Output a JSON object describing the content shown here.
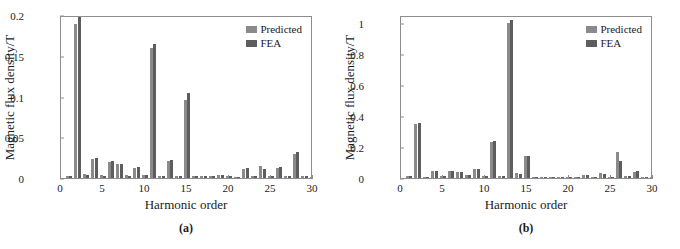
{
  "figure": {
    "panels": [
      {
        "subcaption": "(a)",
        "legend": {
          "predicted": "Predicted",
          "fea": "FEA"
        },
        "chart_data": {
          "type": "bar",
          "title": "",
          "subtitle": "",
          "xlabel": "Harmonic order",
          "ylabel": "Magnetic flux density/T",
          "xlim": [
            0,
            30
          ],
          "ylim": [
            0,
            0.2
          ],
          "xticks": [
            0,
            5,
            10,
            15,
            20,
            25,
            30
          ],
          "yticks": [
            0,
            0.05,
            0.1,
            0.15,
            0.2
          ],
          "ytick_labels": [
            "0",
            "0.05",
            "0.1",
            "0.15",
            "0.2"
          ],
          "grid": false,
          "legend_position": "top-right",
          "categories": [
            1,
            2,
            3,
            4,
            5,
            6,
            7,
            8,
            9,
            10,
            11,
            12,
            13,
            14,
            15,
            16,
            17,
            18,
            19,
            20,
            21,
            22,
            23,
            24,
            25,
            26,
            27,
            28,
            29,
            30
          ],
          "series": [
            {
              "name": "Predicted",
              "color": "#8a8a8a",
              "values": [
                0.003,
                0.189,
                0.005,
                0.023,
                0.004,
                0.02,
                0.017,
                0.004,
                0.012,
                0.004,
                0.16,
                0.003,
                0.021,
                0.003,
                0.096,
                0.002,
                0.003,
                0.002,
                0.004,
                0.002,
                0.001,
                0.011,
                0.002,
                0.015,
                0.002,
                0.012,
                0.002,
                0.03,
                0.002,
                0.001
              ]
            },
            {
              "name": "FEA",
              "color": "#5d5d5d",
              "values": [
                0.003,
                0.197,
                0.004,
                0.024,
                0.003,
                0.021,
                0.017,
                0.003,
                0.013,
                0.004,
                0.164,
                0.003,
                0.022,
                0.003,
                0.104,
                0.002,
                0.003,
                0.002,
                0.004,
                0.002,
                0.001,
                0.012,
                0.002,
                0.011,
                0.002,
                0.014,
                0.002,
                0.032,
                0.002,
                0.001
              ]
            }
          ]
        }
      },
      {
        "subcaption": "(b)",
        "legend": {
          "predicted": "Predicted",
          "fea": "FEA"
        },
        "chart_data": {
          "type": "bar",
          "title": "",
          "subtitle": "",
          "xlabel": "Harmonic order",
          "ylabel": "Magnetic flux density/T",
          "xlim": [
            0,
            30
          ],
          "ylim": [
            0,
            1.05
          ],
          "xticks": [
            0,
            5,
            10,
            15,
            20,
            25,
            30
          ],
          "yticks": [
            0,
            0.2,
            0.4,
            0.6,
            0.8,
            1
          ],
          "ytick_labels": [
            "0",
            "0.2",
            "0.4",
            "0.6",
            "0.8",
            "1"
          ],
          "grid": false,
          "legend_position": "top-right",
          "categories": [
            1,
            2,
            3,
            4,
            5,
            6,
            7,
            8,
            9,
            10,
            11,
            12,
            13,
            14,
            15,
            16,
            17,
            18,
            19,
            20,
            21,
            22,
            23,
            24,
            25,
            26,
            27,
            28,
            29,
            30
          ],
          "series": [
            {
              "name": "Predicted",
              "color": "#8a8a8a",
              "values": [
                0.01,
                0.35,
                0.008,
                0.046,
                0.012,
                0.042,
                0.038,
                0.02,
                0.055,
                0.01,
                0.23,
                0.012,
                1.0,
                0.03,
                0.14,
                0.008,
                0.006,
                0.006,
                0.006,
                0.006,
                0.006,
                0.018,
                0.006,
                0.03,
                0.008,
                0.168,
                0.012,
                0.04,
                0.008,
                0.006
              ]
            },
            {
              "name": "FEA",
              "color": "#5d5d5d",
              "values": [
                0.01,
                0.357,
                0.008,
                0.048,
                0.012,
                0.043,
                0.04,
                0.022,
                0.058,
                0.01,
                0.238,
                0.012,
                1.02,
                0.028,
                0.142,
                0.008,
                0.006,
                0.006,
                0.006,
                0.006,
                0.006,
                0.02,
                0.006,
                0.024,
                0.008,
                0.11,
                0.01,
                0.045,
                0.008,
                0.006
              ]
            }
          ]
        }
      }
    ]
  }
}
